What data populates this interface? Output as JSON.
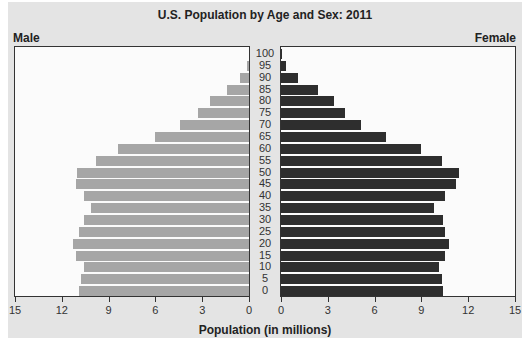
{
  "chart_data": {
    "type": "bar",
    "subtype": "population-pyramid",
    "title": "U.S. Population by Age and Sex: 2011",
    "xlabel": "Population (in millions)",
    "ylabel": "",
    "xlim": [
      0,
      15
    ],
    "x_ticks": [
      0,
      3,
      6,
      9,
      12,
      15
    ],
    "grid": false,
    "legend": "side labels: Male (left), Female (right)",
    "categories": [
      "0",
      "5",
      "10",
      "15",
      "20",
      "25",
      "30",
      "35",
      "40",
      "45",
      "50",
      "55",
      "60",
      "65",
      "70",
      "75",
      "80",
      "85",
      "90",
      "95",
      "100"
    ],
    "series": [
      {
        "name": "Male",
        "color": "#a6a6a6",
        "values": [
          10.9,
          10.8,
          10.6,
          11.1,
          11.3,
          10.9,
          10.6,
          10.1,
          10.6,
          11.1,
          11.0,
          9.8,
          8.4,
          6.0,
          4.4,
          3.3,
          2.5,
          1.4,
          0.6,
          0.1,
          0.0
        ]
      },
      {
        "name": "Female",
        "color": "#2e2e2e",
        "values": [
          10.4,
          10.3,
          10.1,
          10.5,
          10.8,
          10.5,
          10.4,
          9.8,
          10.5,
          11.2,
          11.4,
          10.3,
          9.0,
          6.7,
          5.1,
          4.1,
          3.4,
          2.4,
          1.1,
          0.3,
          0.05
        ]
      }
    ]
  },
  "labels": {
    "title": "U.S. Population by Age and Sex: 2011",
    "male": "Male",
    "female": "Female",
    "xlabel": "Population (in millions)"
  }
}
